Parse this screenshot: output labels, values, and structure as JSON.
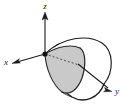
{
  "figure": {
    "title": "",
    "background_color": "#ffffff",
    "stroke_color": "#1a1a1a",
    "shade_color": "#c9c9c9",
    "shade_edge_color": "#2a2a2a"
  },
  "axes": {
    "z": {
      "label": "z",
      "label_x": 45,
      "label_y": 9,
      "direction": "up",
      "arrow_name": "z-axis-arrow"
    },
    "x": {
      "label": "x",
      "label_x": 6,
      "label_y": 65,
      "direction": "lower-left",
      "arrow_name": "x-axis-arrow"
    },
    "y": {
      "label": "y",
      "label_x": 117,
      "label_y": 94,
      "direction": "lower-right",
      "arrow_name": "y-axis-arrow"
    }
  },
  "origin": {
    "label": "",
    "cx": 45,
    "cy": 54,
    "r": 2.6
  },
  "surface": {
    "type": "cone",
    "apex": {
      "x": 45,
      "y": 54
    },
    "opening_center": {
      "x": 92,
      "y": 63
    },
    "opening_rx": 22,
    "opening_ry": 29,
    "opening_rotation_deg": -22
  },
  "shaded_region": {
    "name": "cross-section",
    "fill": "#c9c9c9"
  },
  "dashed_line": {
    "name": "y-axis-hidden-segment",
    "dash_pattern": "2,2"
  }
}
